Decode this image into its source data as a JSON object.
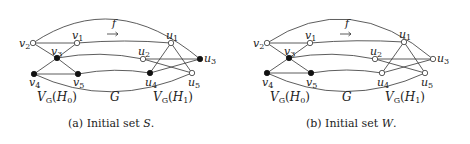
{
  "panels": [
    {
      "id": "a",
      "caption_prefix": "(a) Initial set ",
      "caption_set": "S",
      "caption_suffix": ".",
      "map_label": "f",
      "graph_label": "G",
      "left_set_label": "V_G(H_0)",
      "right_set_label": "V_G(H_1)",
      "nodes": [
        {
          "id": "v1",
          "label": "v",
          "sub": "1",
          "filled": false
        },
        {
          "id": "v2",
          "label": "v",
          "sub": "2",
          "filled": false
        },
        {
          "id": "v3",
          "label": "v",
          "sub": "3",
          "filled": true
        },
        {
          "id": "v4",
          "label": "v",
          "sub": "4",
          "filled": true
        },
        {
          "id": "v5",
          "label": "v",
          "sub": "5",
          "filled": true
        },
        {
          "id": "u1",
          "label": "u",
          "sub": "1",
          "filled": false
        },
        {
          "id": "u2",
          "label": "u",
          "sub": "2",
          "filled": false
        },
        {
          "id": "u3",
          "label": "u",
          "sub": "3",
          "filled": true
        },
        {
          "id": "u4",
          "label": "u",
          "sub": "4",
          "filled": true
        },
        {
          "id": "u5",
          "label": "u",
          "sub": "5",
          "filled": false
        }
      ]
    },
    {
      "id": "b",
      "caption_prefix": "(b) Initial set ",
      "caption_set": "W",
      "caption_suffix": ".",
      "map_label": "f",
      "graph_label": "G",
      "left_set_label": "V_G(H_0)",
      "right_set_label": "V_G(H_1)",
      "nodes": [
        {
          "id": "v1",
          "label": "v",
          "sub": "1",
          "filled": false
        },
        {
          "id": "v2",
          "label": "v",
          "sub": "2",
          "filled": false
        },
        {
          "id": "v3",
          "label": "v",
          "sub": "3",
          "filled": true
        },
        {
          "id": "v4",
          "label": "v",
          "sub": "4",
          "filled": true
        },
        {
          "id": "v5",
          "label": "v",
          "sub": "5",
          "filled": true
        },
        {
          "id": "u1",
          "label": "u",
          "sub": "1",
          "filled": false
        },
        {
          "id": "u2",
          "label": "u",
          "sub": "2",
          "filled": false
        },
        {
          "id": "u3",
          "label": "u",
          "sub": "3",
          "filled": false
        },
        {
          "id": "u4",
          "label": "u",
          "sub": "4",
          "filled": false
        },
        {
          "id": "u5",
          "label": "u",
          "sub": "5",
          "filled": false
        }
      ]
    }
  ],
  "edges": [
    [
      "v2",
      "v1"
    ],
    [
      "v2",
      "v3"
    ],
    [
      "v1",
      "v3"
    ],
    [
      "v3",
      "v4"
    ],
    [
      "v3",
      "v5"
    ],
    [
      "v4",
      "v5"
    ],
    [
      "v2",
      "u3"
    ],
    [
      "v1",
      "u1"
    ],
    [
      "v3",
      "u2"
    ],
    [
      "v5",
      "u4"
    ],
    [
      "v4",
      "u5"
    ],
    [
      "u1",
      "u4"
    ],
    [
      "u1",
      "u5"
    ],
    [
      "u2",
      "u3"
    ],
    [
      "u2",
      "u5"
    ],
    [
      "u4",
      "u3"
    ]
  ],
  "colors": {
    "edge": "#333333",
    "filled_node": "#111111",
    "hollow_node": "#ffffff"
  }
}
